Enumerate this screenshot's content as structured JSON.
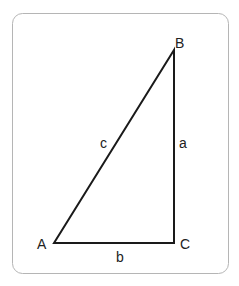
{
  "diagram": {
    "vertices": [
      {
        "id": "A",
        "label": "A"
      },
      {
        "id": "B",
        "label": "B"
      },
      {
        "id": "C",
        "label": "C"
      }
    ],
    "sides": [
      {
        "id": "a",
        "label": "a",
        "from": "B",
        "to": "C"
      },
      {
        "id": "b",
        "label": "b",
        "from": "A",
        "to": "C"
      },
      {
        "id": "c",
        "label": "c",
        "from": "A",
        "to": "B"
      }
    ],
    "colors": {
      "frame": "#b5b5b5",
      "stroke": "#1a1a1a",
      "text": "#222222"
    }
  }
}
